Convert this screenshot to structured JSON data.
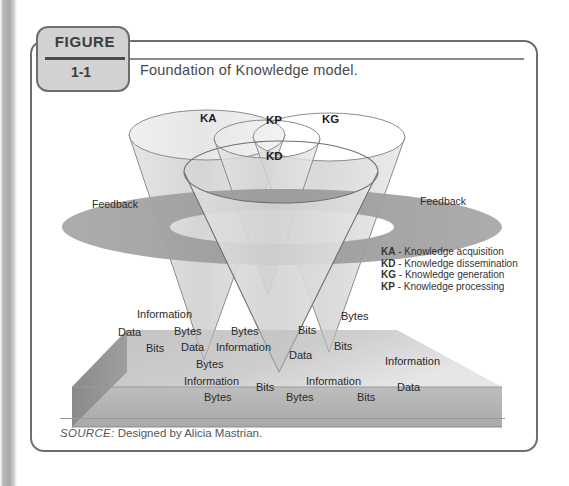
{
  "figure": {
    "tab_word": "FIGURE",
    "number": "1-1",
    "caption": "Foundation of Knowledge model."
  },
  "source": {
    "label": "SOURCE:",
    "text": "Designed by Alicia Mastrian."
  },
  "diagram": {
    "cones": [
      {
        "code": "KA",
        "x": 200,
        "y": 118
      },
      {
        "code": "KP",
        "x": 266,
        "y": 120
      },
      {
        "code": "KG",
        "x": 322,
        "y": 119
      },
      {
        "code": "KD",
        "x": 266,
        "y": 153
      }
    ],
    "feedback_labels": [
      {
        "text": "Feedback",
        "x": 92,
        "y": 197
      },
      {
        "text": "Feedback",
        "x": 420,
        "y": 194
      }
    ],
    "slab_top_words": [
      {
        "text": "Information",
        "x": 137,
        "y": 308
      },
      {
        "text": "Data",
        "x": 118,
        "y": 326
      },
      {
        "text": "Bytes",
        "x": 174,
        "y": 325
      },
      {
        "text": "Bytes",
        "x": 231,
        "y": 325
      },
      {
        "text": "Bits",
        "x": 298,
        "y": 324
      },
      {
        "text": "Bytes",
        "x": 341,
        "y": 310
      },
      {
        "text": "Bits",
        "x": 146,
        "y": 342
      },
      {
        "text": "Data",
        "x": 181,
        "y": 341
      },
      {
        "text": "Information",
        "x": 216,
        "y": 341
      },
      {
        "text": "Data",
        "x": 289,
        "y": 349
      },
      {
        "text": "Bits",
        "x": 334,
        "y": 340
      },
      {
        "text": "Bytes",
        "x": 196,
        "y": 358
      },
      {
        "text": "Information",
        "x": 385,
        "y": 355
      }
    ],
    "slab_front_words": [
      {
        "text": "Information",
        "x": 184,
        "y": 375
      },
      {
        "text": "Information",
        "x": 306,
        "y": 375
      },
      {
        "text": "Bits",
        "x": 256,
        "y": 381
      },
      {
        "text": "Data",
        "x": 397,
        "y": 381
      },
      {
        "text": "Bytes",
        "x": 204,
        "y": 391
      },
      {
        "text": "Bytes",
        "x": 286,
        "y": 391
      },
      {
        "text": "Bits",
        "x": 357,
        "y": 391
      }
    ]
  },
  "legend": {
    "items": [
      {
        "code": "KA",
        "sep": " - ",
        "text": "Knowledge acquisition"
      },
      {
        "code": "KD",
        "sep": " - ",
        "text": "Knowledge dissemination"
      },
      {
        "code": "KG",
        "sep": " - ",
        "text": "Knowledge generation"
      },
      {
        "code": "KP",
        "sep": " - ",
        "text": "Knowledge processing"
      }
    ]
  },
  "colors": {
    "border": "#6e6e6e",
    "tab_fill": "#d2d2d2",
    "cone_fill": "#d8d8d8",
    "slab_top": "#c9c9c9",
    "slab_front": "#b3b3b3",
    "slab_side": "#8f8f8f",
    "ring": "#9d9d9d"
  }
}
